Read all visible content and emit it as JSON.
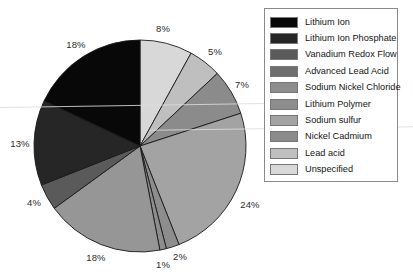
{
  "chart_data": {
    "type": "pie",
    "title": "",
    "subtitle": "",
    "xlabel": "",
    "ylabel": "",
    "legend_position": "right",
    "grid": false,
    "start_angle_deg": 90,
    "direction": "clockwise",
    "units": "percent",
    "categories": [
      "Lithium Ion",
      "Lithium Ion Phosphate",
      "Vanadium Redox Flow",
      "Advanced Lead Acid",
      "Sodium Nickel Chloride",
      "Lithium Polymer",
      "Sodium sulfur",
      "Nickel Cadmium",
      "Lead acid",
      "Unspecified"
    ],
    "values": [
      18,
      13,
      4,
      18,
      1,
      2,
      24,
      7,
      5,
      8
    ],
    "colors": [
      "#0a0a0a",
      "#252525",
      "#4a4a4a",
      "#6e6e6e",
      "#8d8d8d",
      "#8d8d8d",
      "#a0a0a0",
      "#8b8b8b",
      "#bfbfbf",
      "#d8d8d8"
    ],
    "slices": [
      {
        "label": "Unspecified",
        "value": 8,
        "value_label": "8%",
        "color": "#d8d8d8"
      },
      {
        "label": "Lead acid",
        "value": 5,
        "value_label": "5%",
        "color": "#bfbfbf"
      },
      {
        "label": "Nickel Cadmium",
        "value": 7,
        "value_label": "7%",
        "color": "#8b8b8b"
      },
      {
        "label": "Sodium sulfur",
        "value": 24,
        "value_label": "24%",
        "color": "#a3a3a3"
      },
      {
        "label": "Lithium Polymer",
        "value": 2,
        "value_label": "2%",
        "color": "#8d8d8d"
      },
      {
        "label": "Sodium Nickel Chloride",
        "value": 1,
        "value_label": "1%",
        "color": "#8d8d8d"
      },
      {
        "label": "Advanced Lead Acid",
        "value": 18,
        "value_label": "18%",
        "color": "#969696"
      },
      {
        "label": "Vanadium Redox Flow",
        "value": 4,
        "value_label": "4%",
        "color": "#5a5a5a"
      },
      {
        "label": "Lithium Ion Phosphate",
        "value": 13,
        "value_label": "13%",
        "color": "#262626"
      },
      {
        "label": "Lithium Ion",
        "value": 18,
        "value_label": "18%",
        "color": "#080808"
      }
    ],
    "data_labels": [
      {
        "name": "unspecified",
        "text": "8%",
        "x": 163,
        "y": 28
      },
      {
        "name": "lead-acid",
        "text": "5%",
        "x": 215,
        "y": 51
      },
      {
        "name": "nickel-cadmium",
        "text": "7%",
        "x": 242,
        "y": 84
      },
      {
        "name": "sodium-sulfur",
        "text": "24%",
        "x": 250,
        "y": 204
      },
      {
        "name": "lithium-polymer",
        "text": "2%",
        "x": 180,
        "y": 256
      },
      {
        "name": "sodium-nickel-chloride",
        "text": "1%",
        "x": 163,
        "y": 264
      },
      {
        "name": "advanced-lead-acid",
        "text": "18%",
        "x": 96,
        "y": 257
      },
      {
        "name": "vanadium-redox-flow",
        "text": "4%",
        "x": 34,
        "y": 202
      },
      {
        "name": "lithium-ion-phosphate",
        "text": "13%",
        "x": 20,
        "y": 143
      },
      {
        "name": "lithium-ion",
        "text": "18%",
        "x": 76,
        "y": 44
      }
    ]
  },
  "legend": {
    "items": [
      {
        "label": "Lithium Ion",
        "color": "#080808"
      },
      {
        "label": "Lithium Ion Phosphate",
        "color": "#262626"
      },
      {
        "label": "Vanadium Redox Flow",
        "color": "#5a5a5a"
      },
      {
        "label": "Advanced Lead Acid",
        "color": "#6e6e6e"
      },
      {
        "label": "Sodium Nickel Chloride",
        "color": "#8d8d8d"
      },
      {
        "label": "Lithium Polymer",
        "color": "#8d8d8d"
      },
      {
        "label": "Sodium sulfur",
        "color": "#a3a3a3"
      },
      {
        "label": "Nickel Cadmium",
        "color": "#8b8b8b"
      },
      {
        "label": "Lead acid",
        "color": "#bfbfbf"
      },
      {
        "label": "Unspecified",
        "color": "#d8d8d8"
      }
    ]
  },
  "geometry": {
    "center_x": 140,
    "center_y": 146,
    "radius": 106
  }
}
